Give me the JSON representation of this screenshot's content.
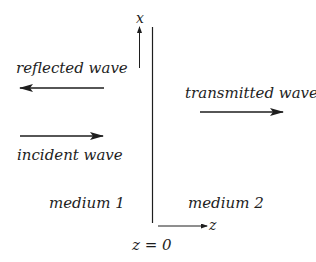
{
  "diagram": {
    "labels": {
      "reflected": "reflected wave",
      "incident": "incident wave",
      "transmitted": "transmitted wave",
      "medium1": "medium 1",
      "medium2": "medium 2",
      "boundary": "z = 0",
      "x_axis": "x",
      "z_axis": "z"
    },
    "colors": {
      "ink": "#1e1e1e",
      "background": "#ffffff"
    }
  }
}
